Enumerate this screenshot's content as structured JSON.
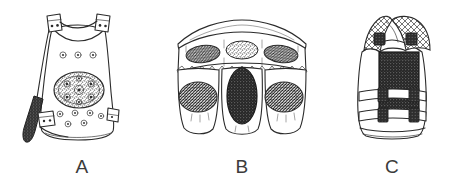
{
  "plate": {
    "title": "Line drawings of three body-armour / vest forms",
    "background_color": "#ffffff",
    "ink_color": "#2b2b2b",
    "label_color": "#3b3b3b",
    "width": 469,
    "height": 182
  },
  "figures": [
    {
      "id": "figure-a",
      "label": "A",
      "label_x": 82,
      "label_y": 173,
      "caption_text": "A",
      "description": "Trapezoidal front body-armour panel with two shoulder buckle tabs, a central circular studded rosette boss, rows of small ring studs, and a dark hanging side strap with buckle on the lower left",
      "parts": [
        {
          "name": "shoulder-strap-buckle-left",
          "count": 1
        },
        {
          "name": "shoulder-strap-buckle-right",
          "count": 1
        },
        {
          "name": "upper-stud-row",
          "count": 3
        },
        {
          "name": "central-rosette-boss",
          "count": 1
        },
        {
          "name": "lower-stud-cluster",
          "count": 7
        },
        {
          "name": "side-strap-dark",
          "count": 1
        },
        {
          "name": "side-buckle-left",
          "count": 1
        },
        {
          "name": "side-buckle-right",
          "count": 1
        }
      ]
    },
    {
      "id": "figure-b",
      "label": "B",
      "label_x": 242,
      "label_y": 173,
      "caption_text": "B",
      "description": "Wide three-lobed armour skirt or pteruges panel with an arched upper band, three stippled oval plaques above a stitched seam line and three larger stippled oval plaques below, the central lower plaque rendered solid dark",
      "parts": [
        {
          "name": "arched-top-band",
          "count": 1
        },
        {
          "name": "upper-oval-plaque",
          "count": 3
        },
        {
          "name": "stitched-seam-line",
          "count": 1
        },
        {
          "name": "lower-lobe",
          "count": 3
        },
        {
          "name": "lower-oval-plaque",
          "count": 3
        },
        {
          "name": "dark-center-plaque",
          "count": 1
        }
      ]
    },
    {
      "id": "figure-c",
      "label": "C",
      "label_x": 392,
      "label_y": 173,
      "caption_text": "C",
      "description": "Modern tactical vest with cross-hatched mesh shoulder straps, dark buckle tabs at the shoulders, a large dark rectangular armour plate on the chest, and two horizontal webbing bands each with two buckle tabs",
      "parts": [
        {
          "name": "mesh-shoulder-strap-left",
          "count": 1
        },
        {
          "name": "mesh-shoulder-strap-right",
          "count": 1
        },
        {
          "name": "shoulder-buckle-tab",
          "count": 2
        },
        {
          "name": "chest-armour-plate-dark",
          "count": 1
        },
        {
          "name": "webbing-band",
          "count": 2
        },
        {
          "name": "webbing-buckle-tab",
          "count": 4
        },
        {
          "name": "hem-line",
          "count": 1
        }
      ]
    }
  ]
}
